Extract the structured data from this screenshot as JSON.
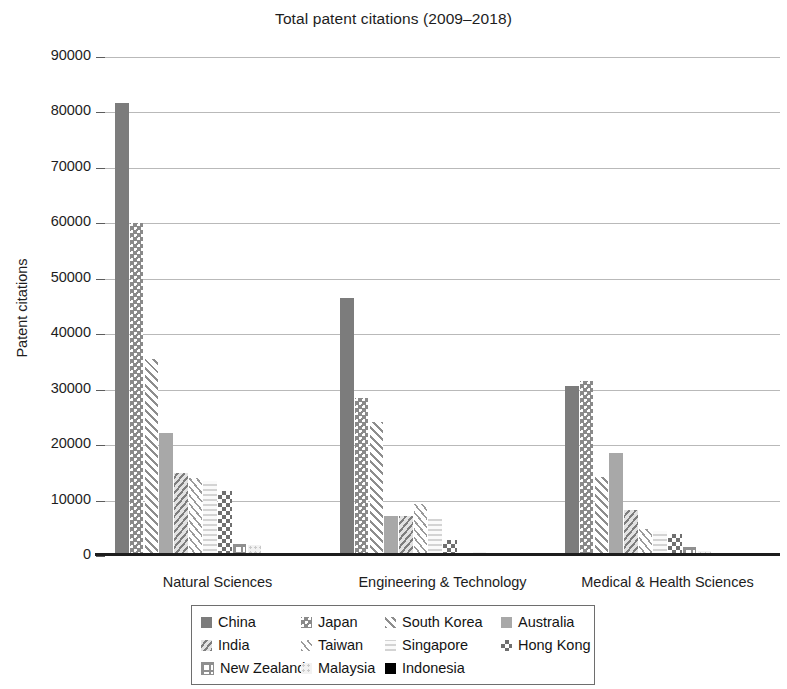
{
  "chart_data": {
    "type": "bar",
    "title": "Total patent citations (2009–2018)",
    "xlabel": "",
    "ylabel": "Patent citations",
    "ylim": [
      0,
      90000
    ],
    "ytick_labels": [
      "0",
      "10000",
      "20000",
      "30000",
      "40000",
      "50000",
      "60000",
      "70000",
      "80000",
      "90000"
    ],
    "ytick_values": [
      0,
      10000,
      20000,
      30000,
      40000,
      50000,
      60000,
      70000,
      80000,
      90000
    ],
    "grid": true,
    "legend_position": "bottom",
    "categories": [
      "Natural Sciences",
      "Engineering & Technology",
      "Medical & Health Sciences"
    ],
    "series": [
      {
        "name": "China",
        "pattern": "solid-dark-gray",
        "color": "#7c7c7c",
        "values": [
          81700,
          46500,
          30600
        ]
      },
      {
        "name": "Japan",
        "pattern": "dotted-gray",
        "color": "#8a8a8a",
        "values": [
          60000,
          28500,
          31500
        ]
      },
      {
        "name": "South Korea",
        "pattern": "diagonal-hatch",
        "color": "#8d8d8d",
        "values": [
          35600,
          24100,
          14300
        ]
      },
      {
        "name": "Australia",
        "pattern": "solid-mid-gray",
        "color": "#a8a8a8",
        "values": [
          22200,
          7300,
          18500
        ]
      },
      {
        "name": "India",
        "pattern": "dense-diagonal",
        "color": "#7e7e7e",
        "values": [
          15000,
          7200,
          8300
        ]
      },
      {
        "name": "Taiwan",
        "pattern": "thin-diagonal",
        "color": "#9a9a9a",
        "values": [
          14000,
          9300,
          4800
        ]
      },
      {
        "name": "Singapore",
        "pattern": "horizontal-light",
        "color": "#d3d3d3",
        "values": [
          13600,
          6600,
          4500
        ]
      },
      {
        "name": "Hong Kong",
        "pattern": "checkerboard",
        "color": "#6f6f6f",
        "values": [
          11700,
          2900,
          3900
        ]
      },
      {
        "name": "New Zealand",
        "pattern": "grid-lines",
        "color": "#8f8f8f",
        "values": [
          2100,
          500,
          1600
        ]
      },
      {
        "name": "Malaysia",
        "pattern": "fine-dots-light",
        "color": "#c9c9c9",
        "values": [
          1900,
          700,
          900
        ]
      },
      {
        "name": "Indonesia",
        "pattern": "solid-black",
        "color": "#000000",
        "values": [
          200,
          100,
          100
        ]
      }
    ]
  },
  "legend": {
    "rows": [
      [
        "China",
        "Japan",
        "South Korea",
        "Australia"
      ],
      [
        "India",
        "Taiwan",
        "Singapore",
        "Hong Kong"
      ],
      [
        "New Zealand",
        "Malaysia",
        "Indonesia"
      ]
    ]
  }
}
